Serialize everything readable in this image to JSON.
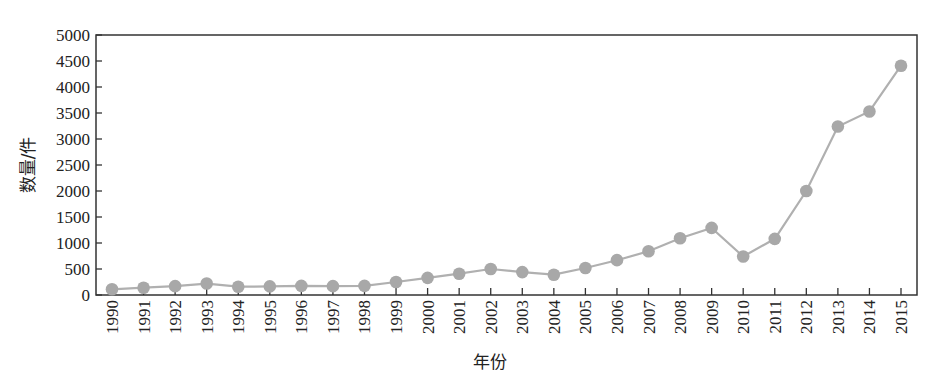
{
  "chart_data": {
    "type": "line",
    "title": "",
    "xlabel": "年份",
    "ylabel": "数量/件",
    "ylim": [
      0,
      5000
    ],
    "yticks": [
      0,
      500,
      1000,
      1500,
      2000,
      2500,
      3000,
      3500,
      4000,
      4500,
      5000
    ],
    "grid": false,
    "legend": null,
    "categories": [
      "1990",
      "1991",
      "1992",
      "1993",
      "1994",
      "1995",
      "1996",
      "1997",
      "1998",
      "1999",
      "2000",
      "2001",
      "2002",
      "2003",
      "2004",
      "2005",
      "2006",
      "2007",
      "2008",
      "2009",
      "2010",
      "2011",
      "2012",
      "2013",
      "2014",
      "2015"
    ],
    "series": [
      {
        "name": "数量",
        "values": [
          110,
          140,
          170,
          220,
          160,
          165,
          175,
          170,
          175,
          250,
          330,
          410,
          500,
          440,
          390,
          520,
          670,
          840,
          1090,
          1290,
          740,
          1080,
          2000,
          3240,
          3530,
          4410
        ],
        "color": "#b0b0b0",
        "marker_color": "#a8a8a8",
        "marker": "circle"
      }
    ]
  }
}
